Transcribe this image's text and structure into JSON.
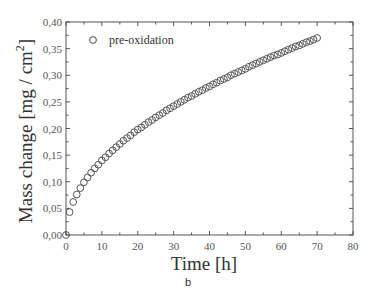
{
  "chart_data": {
    "type": "scatter",
    "title": "",
    "xlabel": "Time [h]",
    "ylabel": "Mass change [mg / cm²]",
    "ylabel_main": "Mass change [mg / cm",
    "ylabel_sup": "2",
    "ylabel_end": "]",
    "xlim": [
      0,
      80
    ],
    "ylim": [
      0.0,
      0.4
    ],
    "xticks": [
      0,
      10,
      20,
      30,
      40,
      50,
      60,
      70,
      80
    ],
    "xtick_labels": [
      "0",
      "10",
      "20",
      "30",
      "40",
      "50",
      "60",
      "70",
      "80"
    ],
    "yticks": [
      0.0,
      0.05,
      0.1,
      0.15,
      0.2,
      0.25,
      0.3,
      0.35,
      0.4
    ],
    "ytick_labels": [
      "0,00",
      "0,05",
      "0,10",
      "0,15",
      "0,20",
      "0,25",
      "0,30",
      "0,35",
      "0,40"
    ],
    "grid": false,
    "legend_position": "upper left",
    "marker": "open-circle",
    "series": [
      {
        "name": "pre-oxidation",
        "x": [
          0,
          1,
          2,
          3,
          4,
          5,
          6,
          7,
          8,
          9,
          10,
          11,
          12,
          13,
          14,
          15,
          16,
          17,
          18,
          19,
          20,
          21,
          22,
          23,
          24,
          25,
          26,
          27,
          28,
          29,
          30,
          31,
          32,
          33,
          34,
          35,
          36,
          37,
          38,
          39,
          40,
          41,
          42,
          43,
          44,
          45,
          46,
          47,
          48,
          49,
          50,
          51,
          52,
          53,
          54,
          55,
          56,
          57,
          58,
          59,
          60,
          61,
          62,
          63,
          64,
          65,
          66,
          67,
          68,
          69,
          70
        ],
        "values": [
          0.0,
          0.043,
          0.062,
          0.076,
          0.088,
          0.099,
          0.108,
          0.117,
          0.125,
          0.132,
          0.14,
          0.146,
          0.153,
          0.159,
          0.165,
          0.171,
          0.177,
          0.182,
          0.187,
          0.193,
          0.198,
          0.202,
          0.207,
          0.212,
          0.216,
          0.221,
          0.225,
          0.229,
          0.234,
          0.238,
          0.242,
          0.246,
          0.25,
          0.254,
          0.258,
          0.261,
          0.265,
          0.269,
          0.272,
          0.276,
          0.279,
          0.283,
          0.286,
          0.29,
          0.293,
          0.296,
          0.3,
          0.303,
          0.306,
          0.309,
          0.312,
          0.316,
          0.319,
          0.322,
          0.325,
          0.328,
          0.331,
          0.334,
          0.337,
          0.339,
          0.342,
          0.345,
          0.348,
          0.351,
          0.354,
          0.356,
          0.359,
          0.362,
          0.364,
          0.367,
          0.37
        ]
      }
    ]
  },
  "caption": "b"
}
